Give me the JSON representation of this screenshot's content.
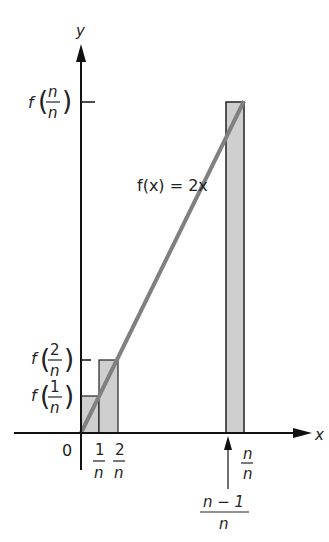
{
  "diagram": {
    "function_label": "f(x) = 2x",
    "axes": {
      "x_label": "x",
      "y_label": "y",
      "origin_label": "0"
    },
    "y_tick_labels": [
      {
        "prefix": "f",
        "numerator": "n",
        "denominator": "n"
      },
      {
        "prefix": "f",
        "numerator": "2",
        "denominator": "n"
      },
      {
        "prefix": "f",
        "numerator": "1",
        "denominator": "n"
      }
    ],
    "x_tick_labels": [
      {
        "numerator": "1",
        "denominator": "n"
      },
      {
        "numerator": "2",
        "denominator": "n"
      },
      {
        "numerator": "n",
        "denominator": "n"
      }
    ],
    "pointer_label": {
      "numerator": "n − 1",
      "denominator": "n"
    },
    "colors": {
      "line": "#808080",
      "rect_fill": "#cfcfcf",
      "axis": "#111111"
    }
  }
}
